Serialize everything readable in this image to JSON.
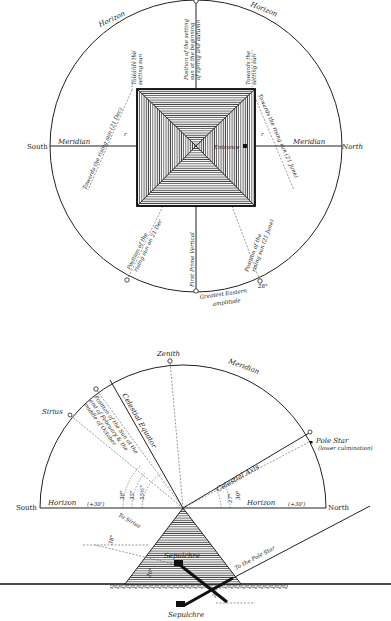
{
  "top_diagram": {
    "title": "Plan view of pyramid orientation",
    "labels": {
      "horizon_left": "Horizon",
      "horizon_right": "Horizon",
      "south": "South",
      "north": "North",
      "meridian_left": "Meridian",
      "meridian_right": "Meridian",
      "entrance": "Entrance",
      "towards_setting_sun_left_1": "Towards the",
      "towards_setting_sun_left_2": "setting sun",
      "towards_setting_sun_right_1": "Towards the",
      "towards_setting_sun_right_2": "setting sun",
      "setting_equinox_1": "Position of the setting",
      "setting_equinox_2": "sun at the beginning",
      "setting_equinox_3": "of spring and autumn",
      "towards_rising_dec": "Towards the rising sun (21 Dec)",
      "towards_rising_june": "Towards the rising sun (21 June)",
      "rising_dec_1": "Position of the",
      "rising_dec_2": "rising sun on 21 Dec",
      "rising_june_1": "Position of the",
      "rising_june_2": "rising sun (21 June)",
      "first_prime_vertical": "First Prime Vertical",
      "greatest_eastern_1": "Greatest Eastern",
      "greatest_eastern_2": "amplitude",
      "angle_mark": "r",
      "angle_28": "28°"
    }
  },
  "bottom_diagram": {
    "title": "Section view of pyramid with celestial alignments",
    "labels": {
      "zenith": "Zenith",
      "meridian": "Meridian",
      "sirius": "Sirius",
      "pole_star": "Pole Star",
      "lower_culmination": "(lower culmination)",
      "celestial_equator": "Celestial Equator",
      "celestial_axis": "Celestial Axis",
      "sun_21_june": "Position of the Sun on 21st June",
      "sun_feb_1": "Position of the Sun at the",
      "sun_feb_2": "end of February & the",
      "sun_feb_3": "middle of October",
      "south": "South",
      "north": "North",
      "horizon_left": "Horizon",
      "horizon_right": "Horizon",
      "refraction_left": "(+30')",
      "refraction_right": "(+30')",
      "angle_38": "38°",
      "angle_35": "35°",
      "angle_55": "55½°",
      "angle_27": "27°",
      "angle_30": "30°",
      "to_sirius": "To Sirius",
      "angle_38b": "38°",
      "to_pole_star": "To the Pole Star",
      "sepulchre_upper": "Sepulchre",
      "sepulchre_lower": "Sepulchre",
      "angle_26": "26°",
      "angle_27b": "27°"
    }
  }
}
